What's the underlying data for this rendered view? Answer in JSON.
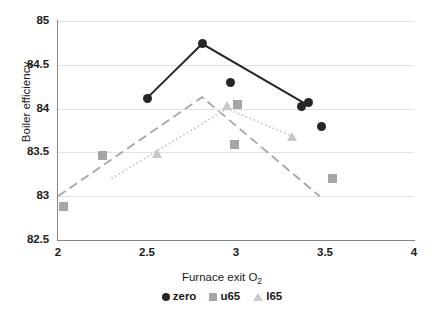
{
  "chart_data": {
    "type": "line",
    "title": "",
    "xlabel": "Furnace exit O2",
    "xlabel_main": "Furnace exit O",
    "xlabel_sub": "2",
    "ylabel": "Boiler efficiency",
    "xlim": [
      2,
      4
    ],
    "ylim": [
      82.5,
      85
    ],
    "xticks": [
      "2",
      "2.5",
      "3",
      "3.5",
      "4"
    ],
    "xtick_values": [
      2,
      2.5,
      3,
      3.5,
      4
    ],
    "yticks": [
      "82.5",
      "83",
      "83.5",
      "84",
      "84.5",
      "85"
    ],
    "ytick_values": [
      82.5,
      83,
      83.5,
      84,
      84.5,
      85
    ],
    "grid": "horizontal",
    "legend_position": "bottom",
    "series": [
      {
        "name": "zero",
        "marker": "circle",
        "color": "#262626",
        "linestyle": "solid",
        "points": [
          {
            "x": 2.5,
            "y": 84.12
          },
          {
            "x": 2.81,
            "y": 84.74
          },
          {
            "x": 3.41,
            "y": 84.03
          }
        ],
        "scatter_points": [
          {
            "x": 2.5,
            "y": 84.12
          },
          {
            "x": 2.81,
            "y": 84.74
          },
          {
            "x": 2.97,
            "y": 84.3
          },
          {
            "x": 3.37,
            "y": 84.02
          },
          {
            "x": 3.41,
            "y": 84.07
          },
          {
            "x": 3.48,
            "y": 83.8
          }
        ]
      },
      {
        "name": "u65",
        "marker": "square",
        "color": "#a6a6a6",
        "linestyle": "dashed",
        "points": [
          {
            "x": 2.0,
            "y": 83.0
          },
          {
            "x": 2.81,
            "y": 84.13
          },
          {
            "x": 3.47,
            "y": 83.0
          }
        ],
        "scatter_points": [
          {
            "x": 2.03,
            "y": 82.88
          },
          {
            "x": 2.25,
            "y": 83.46
          },
          {
            "x": 3.01,
            "y": 84.05
          },
          {
            "x": 2.99,
            "y": 83.59
          },
          {
            "x": 3.54,
            "y": 83.2
          }
        ]
      },
      {
        "name": "l65",
        "marker": "triangle",
        "color": "#c8c8c8",
        "linestyle": "dotted",
        "points": [
          {
            "x": 2.3,
            "y": 83.2
          },
          {
            "x": 2.95,
            "y": 84.0
          },
          {
            "x": 3.32,
            "y": 83.68
          }
        ],
        "scatter_points": [
          {
            "x": 2.56,
            "y": 83.48
          },
          {
            "x": 2.95,
            "y": 84.03
          },
          {
            "x": 3.32,
            "y": 83.68
          }
        ]
      }
    ]
  },
  "legend": {
    "items": [
      {
        "label": "zero",
        "marker": "circle-marker-icon"
      },
      {
        "label": "u65",
        "marker": "square-marker-icon"
      },
      {
        "label": "l65",
        "marker": "triangle-marker-icon"
      }
    ]
  },
  "colors": {
    "zero": "#262626",
    "u65": "#a6a6a6",
    "l65": "#c8c8c8",
    "grid": "#e2e2e2",
    "axis": "#868686"
  }
}
